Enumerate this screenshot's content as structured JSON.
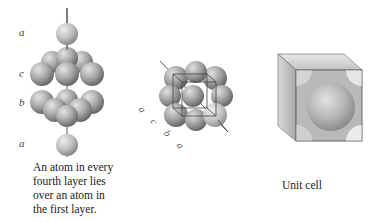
{
  "figure": {
    "panels": [
      {
        "id": "layer-stack",
        "layer_labels": [
          "a",
          "c",
          "b",
          "a"
        ],
        "caption": [
          "An atom in every",
          "fourth layer lies",
          "over an atom in",
          "the first layer."
        ]
      },
      {
        "id": "fcc-rotated",
        "axis_labels": [
          "a",
          "c",
          "b",
          "a"
        ]
      },
      {
        "id": "unit-cell",
        "caption": "Unit cell"
      }
    ],
    "colors": {
      "sphere_light": "#d8d8d8",
      "sphere_mid": "#a8a8a8",
      "sphere_dark": "#6e6e6e",
      "axis_line": "#333333",
      "cube_edge": "#555555"
    }
  }
}
